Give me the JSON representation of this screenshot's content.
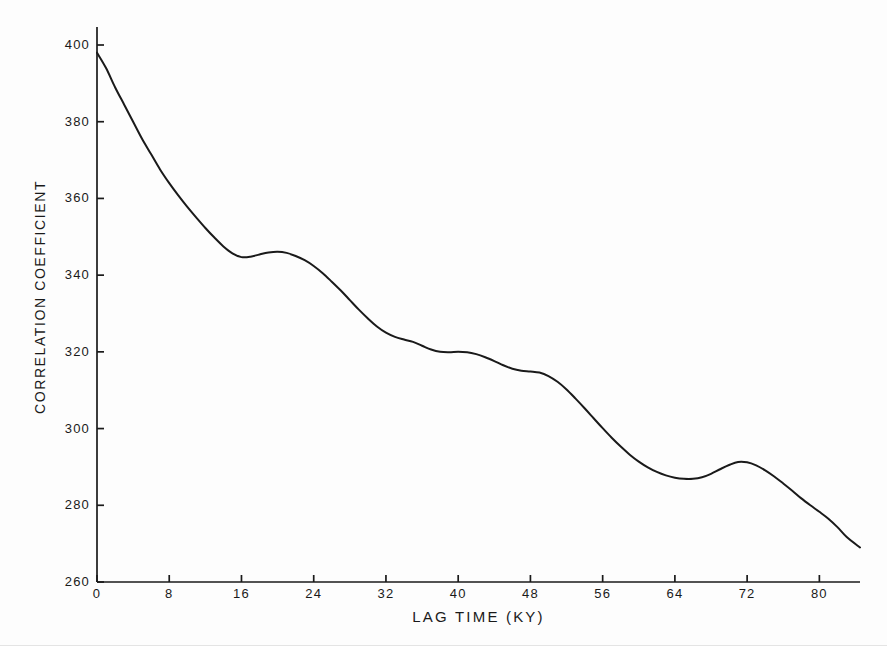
{
  "chart_data": {
    "type": "line",
    "title": "",
    "subtitle": "",
    "xlabel": "LAG  TIME  (KY)",
    "ylabel": "CORRELATION COEFFICIENT",
    "xlim": [
      0,
      84.5
    ],
    "ylim": [
      260,
      400
    ],
    "grid": false,
    "legend": null,
    "legend_position": "none",
    "xticks": [
      0,
      8,
      16,
      24,
      32,
      40,
      48,
      56,
      64,
      72,
      80
    ],
    "xtick_labels": [
      "0",
      "8",
      "16",
      "24",
      "32",
      "40",
      "48",
      "56",
      "64",
      "72",
      "80"
    ],
    "yticks": [
      260,
      280,
      300,
      320,
      340,
      360,
      380,
      400
    ],
    "ytick_labels": [
      "260",
      "280",
      "300",
      "320",
      "340",
      "360",
      "380",
      "400"
    ],
    "line_color": "#1a1a1a",
    "line_width": 2.0,
    "axis_color": "#1a1a1a",
    "background_color": "#fdfdfd",
    "series": [
      {
        "name": "correlation coefficient vs lag time",
        "x": [
          0,
          1,
          2,
          3,
          4,
          5,
          6,
          7,
          8,
          9,
          10,
          11,
          12,
          13,
          14,
          15,
          16,
          17,
          18,
          19,
          20,
          21,
          22,
          23,
          24,
          25,
          26,
          27,
          28,
          29,
          30,
          31,
          32,
          33,
          34,
          35,
          36,
          37,
          38,
          39,
          40,
          41,
          42,
          43,
          44,
          45,
          46,
          47,
          48,
          49,
          50,
          51,
          52,
          53,
          54,
          55,
          56,
          57,
          58,
          59,
          60,
          61,
          62,
          63,
          64,
          65,
          66,
          67,
          68,
          69,
          70,
          71,
          72,
          73,
          74,
          75,
          76,
          77,
          78,
          79,
          80,
          81,
          82,
          83,
          84.5
        ],
        "y": [
          398.0,
          394.0,
          389.0,
          384.5,
          380.0,
          375.5,
          371.5,
          367.5,
          364.0,
          360.8,
          357.8,
          355.0,
          352.3,
          349.8,
          347.5,
          345.7,
          344.7,
          344.8,
          345.4,
          345.9,
          346.1,
          345.8,
          345.0,
          343.9,
          342.4,
          340.5,
          338.3,
          336.0,
          333.5,
          331.0,
          328.7,
          326.6,
          325.0,
          323.9,
          323.2,
          322.6,
          321.6,
          320.6,
          320.0,
          319.9,
          320.0,
          319.9,
          319.4,
          318.6,
          317.6,
          316.5,
          315.6,
          315.1,
          314.9,
          314.6,
          313.7,
          312.2,
          310.2,
          307.8,
          305.3,
          302.7,
          300.1,
          297.6,
          295.3,
          293.2,
          291.4,
          289.9,
          288.7,
          287.8,
          287.2,
          286.9,
          286.9,
          287.3,
          288.2,
          289.4,
          290.5,
          291.3,
          291.2,
          290.4,
          289.1,
          287.5,
          285.7,
          283.8,
          281.8,
          280.0,
          278.3,
          276.5,
          274.3,
          271.8,
          269.0
        ],
        "marker": "none",
        "style": "solid"
      }
    ],
    "annotations": []
  },
  "axes_geometry": {
    "plot_left_px": 97,
    "plot_right_px": 860,
    "plot_top_px": 45,
    "plot_bottom_px": 582,
    "tick_length_px": 7
  }
}
